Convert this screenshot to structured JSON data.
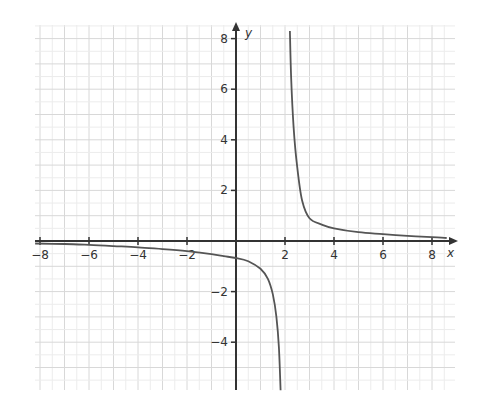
{
  "chart_data": {
    "type": "line",
    "title": "",
    "xlabel": "x",
    "ylabel": "y",
    "xlim": [
      -8.2,
      8.9
    ],
    "ylim": [
      -5.9,
      8.5
    ],
    "grid": true,
    "x_ticks": [
      -8,
      -6,
      -4,
      -2,
      2,
      4,
      6,
      8
    ],
    "x_tick_labels": [
      "−8",
      "−6",
      "−4",
      "−2",
      "2",
      "4",
      "6",
      "8"
    ],
    "y_ticks": [
      8,
      6,
      4,
      2,
      -2,
      -4
    ],
    "y_tick_labels": [
      "8",
      "6",
      "4",
      "2",
      "−2",
      "−4"
    ],
    "vertical_asymptote_x": 2,
    "series": [
      {
        "name": "left-branch",
        "x": [
          -8.2,
          -7,
          -6,
          -5,
          -4,
          -3,
          -2,
          -1,
          -0.5,
          0,
          0.5,
          1,
          1.3,
          1.5,
          1.65,
          1.75,
          1.82
        ],
        "y": [
          -0.1,
          -0.12,
          -0.15,
          -0.2,
          -0.25,
          -0.32,
          -0.4,
          -0.52,
          -0.6,
          -0.67,
          -0.8,
          -1.1,
          -1.5,
          -2.1,
          -3.0,
          -4.2,
          -5.9
        ]
      },
      {
        "name": "right-branch",
        "x": [
          2.2,
          2.25,
          2.35,
          2.5,
          2.7,
          3,
          3.5,
          4,
          5,
          6,
          7,
          8,
          8.6
        ],
        "y": [
          8.3,
          6.5,
          4.5,
          2.9,
          1.6,
          0.9,
          0.65,
          0.5,
          0.35,
          0.27,
          0.2,
          0.15,
          0.12
        ]
      }
    ]
  }
}
